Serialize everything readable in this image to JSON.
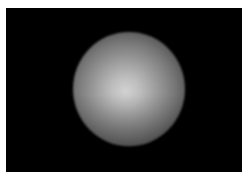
{
  "image": {
    "description": "Glowing gray sphere on a black rectangular background",
    "colors": {
      "page_background": "#ffffff",
      "frame_background": "#000000",
      "sphere_highlight": "#d2d2d2",
      "sphere_edge": "#0a0a0a"
    }
  }
}
